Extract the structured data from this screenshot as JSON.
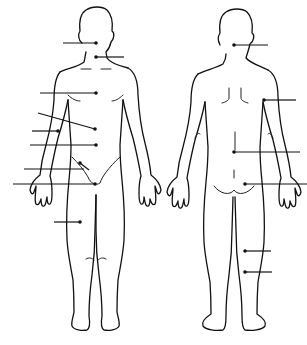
{
  "diagram": {
    "type": "anatomical body regions (blank labeling worksheet)",
    "views": [
      {
        "name": "front",
        "label": ""
      },
      {
        "name": "back",
        "label": ""
      }
    ],
    "colors": {
      "line": "#111111",
      "background": "#ffffff"
    },
    "front_leaders": [
      {
        "id": 1,
        "x1": 63,
        "y1": 43,
        "x2": 96,
        "y2": 43,
        "dot": "end",
        "label": ""
      },
      {
        "id": 2,
        "x1": 96,
        "y1": 57,
        "x2": 124,
        "y2": 57,
        "dot": "start",
        "label": ""
      },
      {
        "id": 3,
        "x1": 40,
        "y1": 93,
        "x2": 96,
        "y2": 93,
        "dot": "end",
        "label": ""
      },
      {
        "id": 4,
        "x1": 38,
        "y1": 113,
        "x2": 95,
        "y2": 129,
        "dot": "end",
        "label": ""
      },
      {
        "id": 5,
        "x1": 32,
        "y1": 131,
        "x2": 58,
        "y2": 131,
        "dot": "end",
        "label": ""
      },
      {
        "id": 6,
        "x1": 30,
        "y1": 145,
        "x2": 96,
        "y2": 145,
        "dot": "end",
        "label": ""
      },
      {
        "id": 7,
        "x1": 80,
        "y1": 163,
        "x2": 89,
        "y2": 170,
        "dot": "start",
        "label": ""
      },
      {
        "id": 8,
        "x1": 24,
        "y1": 169,
        "x2": 84,
        "y2": 169,
        "dot": "none",
        "label": ""
      },
      {
        "id": 9,
        "x1": 13,
        "y1": 184,
        "x2": 95,
        "y2": 184,
        "dot": "end",
        "label": ""
      },
      {
        "id": 10,
        "x1": 54,
        "y1": 222,
        "x2": 80,
        "y2": 222,
        "dot": "end",
        "label": ""
      }
    ],
    "back_leaders": [
      {
        "id": 11,
        "x1": 234,
        "y1": 45,
        "x2": 268,
        "y2": 45,
        "dot": "start",
        "label": ""
      },
      {
        "id": 12,
        "x1": 264,
        "y1": 100,
        "x2": 296,
        "y2": 100,
        "dot": "start",
        "label": ""
      },
      {
        "id": 13,
        "x1": 234,
        "y1": 152,
        "x2": 300,
        "y2": 152,
        "dot": "start",
        "label": ""
      },
      {
        "id": 14,
        "x1": 245,
        "y1": 184,
        "x2": 307,
        "y2": 184,
        "dot": "start",
        "label": ""
      },
      {
        "id": 15,
        "x1": 245,
        "y1": 251,
        "x2": 271,
        "y2": 251,
        "dot": "start",
        "label": ""
      },
      {
        "id": 16,
        "x1": 245,
        "y1": 272,
        "x2": 272,
        "y2": 272,
        "dot": "start",
        "label": ""
      }
    ]
  }
}
